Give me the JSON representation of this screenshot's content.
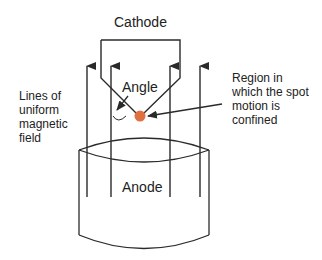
{
  "labels": {
    "cathode": "Cathode",
    "anode": "Anode",
    "angle": "Angle",
    "field": [
      "Lines of",
      "uniform",
      "magnetic",
      "field"
    ],
    "region": [
      "Region in",
      "which the spot",
      "motion is",
      "confined"
    ]
  },
  "colors": {
    "line": "#2a2a2a",
    "spot": "#e0703f"
  }
}
